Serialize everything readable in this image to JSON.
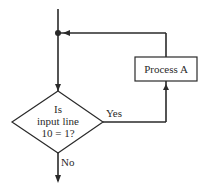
{
  "diagram": {
    "type": "flowchart",
    "nodes": [
      {
        "id": "junction",
        "shape": "dot"
      },
      {
        "id": "decision",
        "shape": "diamond",
        "lines": [
          "Is",
          "input line",
          "10 = 1?"
        ]
      },
      {
        "id": "process_a",
        "shape": "rectangle",
        "label": "Process A"
      }
    ],
    "edges": [
      {
        "from": "entry",
        "to": "junction",
        "label": ""
      },
      {
        "from": "junction",
        "to": "decision",
        "label": ""
      },
      {
        "from": "decision",
        "to": "process_a",
        "label": "Yes"
      },
      {
        "from": "process_a",
        "to": "junction",
        "label": ""
      },
      {
        "from": "decision",
        "to": "exit",
        "label": "No"
      }
    ],
    "labels": {
      "decision_line1": "Is",
      "decision_line2": "input line",
      "decision_line3": "10 = 1?",
      "process": "Process A",
      "yes": "Yes",
      "no": "No"
    },
    "colors": {
      "stroke": "#2a2a2a",
      "background": "#ffffff"
    }
  }
}
